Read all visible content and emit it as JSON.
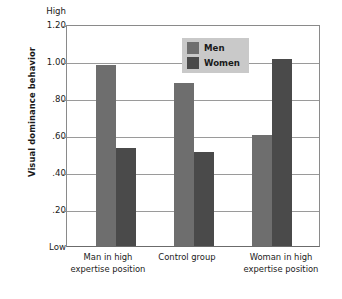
{
  "chart_data": {
    "type": "bar",
    "title": "",
    "xlabel": "",
    "ylabel": "Visual dominance behavior",
    "ylim": [
      0,
      1.2
    ],
    "grid": true,
    "legend_position": "inside-top-center",
    "categories": [
      "Man in high\nexpertise position",
      "Control group",
      "Woman in high\nexpertise position"
    ],
    "category_lines": [
      [
        "Man in high",
        "expertise position"
      ],
      [
        "Control group",
        ""
      ],
      [
        "Woman in high",
        "expertise position"
      ]
    ],
    "series": [
      {
        "name": "Men",
        "values": [
          0.98,
          0.88,
          0.6
        ],
        "color": "#6e6e6e"
      },
      {
        "name": "Women",
        "values": [
          0.53,
          0.51,
          1.01
        ],
        "color": "#4a4a4a"
      }
    ],
    "y_ticks": [
      {
        "value": 1.2,
        "label": "1.20"
      },
      {
        "value": 1.0,
        "label": "1.00"
      },
      {
        "value": 0.8,
        "label": ".80"
      },
      {
        "value": 0.6,
        "label": ".60"
      },
      {
        "value": 0.4,
        "label": ".40"
      },
      {
        "value": 0.2,
        "label": ".20"
      }
    ],
    "y_axis_end_labels": {
      "high": "High",
      "low": "Low"
    }
  },
  "legend": {
    "items": [
      {
        "label": "Men",
        "color": "#6e6e6e"
      },
      {
        "label": "Women",
        "color": "#4a4a4a"
      }
    ],
    "background": "#c9c9c9"
  },
  "axis": {
    "y_title": "Visual dominance behavior",
    "high_label": "High",
    "low_label": "Low",
    "tick_1_20": "1.20",
    "tick_1_00": "1.00",
    "tick_0_80": ".80",
    "tick_0_60": ".60",
    "tick_0_40": ".40",
    "tick_0_20": ".20"
  },
  "x_categories": [
    {
      "line1": "Man in high",
      "line2": "expertise position"
    },
    {
      "line1": "Control group",
      "line2": ""
    },
    {
      "line1": "Woman in high",
      "line2": "expertise position"
    }
  ]
}
